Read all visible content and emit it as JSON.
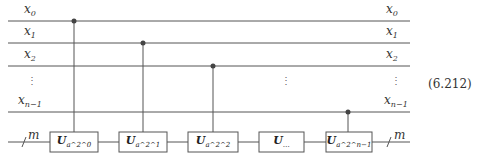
{
  "figure": {
    "equation_number": "(6.212)",
    "register_label": "m",
    "left_labels": [
      {
        "base": "x",
        "sub": "0"
      },
      {
        "base": "x",
        "sub": "1"
      },
      {
        "base": "x",
        "sub": "2"
      },
      {
        "base": "x",
        "sub": "n−1"
      }
    ],
    "right_labels": [
      {
        "base": "x",
        "sub": "0"
      },
      {
        "base": "x",
        "sub": "1"
      },
      {
        "base": "x",
        "sub": "2"
      },
      {
        "base": "x",
        "sub": "n−1"
      }
    ],
    "ellipsis": "⋮",
    "gates": [
      {
        "base": "U",
        "sub": "a^2^0",
        "control_qubit": 0
      },
      {
        "base": "U",
        "sub": "a^2^1",
        "control_qubit": 1
      },
      {
        "base": "U",
        "sub": "a^2^2",
        "control_qubit": 2
      },
      {
        "base": "U",
        "sub": "…",
        "control_qubit": null
      },
      {
        "base": "U",
        "sub": "a^2^n−1",
        "control_qubit": 3
      }
    ]
  }
}
